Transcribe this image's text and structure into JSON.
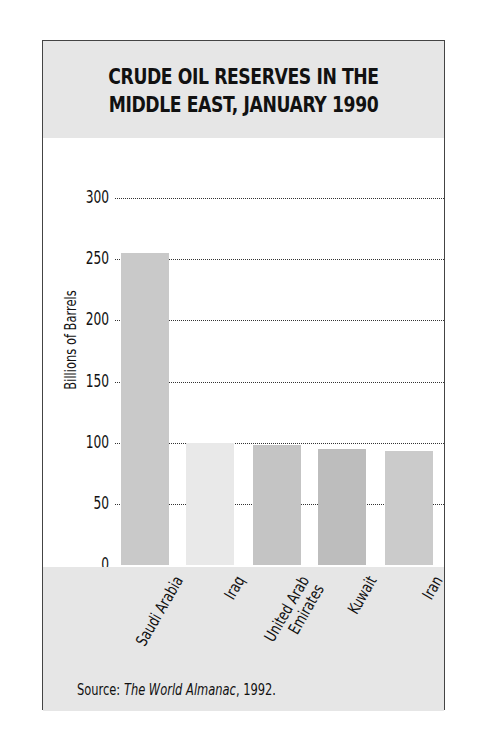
{
  "chart_data": {
    "type": "bar",
    "title_line1": "Crude Oil Reserves in the",
    "title_line2": "Middle East, January 1990",
    "categories": [
      "Saudi Arabia",
      "Iraq",
      "United Arab Emirates",
      "Kuwait",
      "Iran"
    ],
    "category_label_lines": [
      [
        "Saudi Arabia"
      ],
      [
        "Iraq"
      ],
      [
        "United Arab",
        "Emirates"
      ],
      [
        "Kuwait"
      ],
      [
        "Iran"
      ]
    ],
    "values": [
      255,
      100,
      98,
      94.5,
      92.9
    ],
    "bar_colors": [
      "#c9c9c9",
      "#e9e9e9",
      "#c4c4c4",
      "#bdbdbd",
      "#cbcbcb"
    ],
    "xlabel": "",
    "ylabel": "Billions of Barrels",
    "ylim": [
      0,
      300
    ],
    "yticks": [
      0,
      50,
      100,
      150,
      200,
      250,
      300
    ],
    "grid": "horizontal dotted",
    "legend": "none",
    "source_prefix": "Source: ",
    "source_title": "The World Almanac",
    "source_suffix": ", 1992."
  }
}
